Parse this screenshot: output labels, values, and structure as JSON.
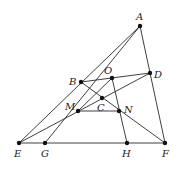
{
  "diagram": {
    "type": "geometry-figure",
    "points": [
      {
        "id": "A",
        "label": "A",
        "x": 140,
        "y": 26,
        "lx": 136,
        "ly": 20
      },
      {
        "id": "B",
        "label": "B",
        "x": 81,
        "y": 82,
        "lx": 69,
        "ly": 85
      },
      {
        "id": "O",
        "label": "O",
        "x": 112,
        "y": 78,
        "lx": 104,
        "ly": 74
      },
      {
        "id": "D",
        "label": "D",
        "x": 150,
        "y": 73,
        "lx": 154,
        "ly": 78
      },
      {
        "id": "C",
        "label": "C",
        "x": 102,
        "y": 98,
        "lx": 97,
        "ly": 111
      },
      {
        "id": "M",
        "label": "M",
        "x": 78,
        "y": 111,
        "lx": 65,
        "ly": 110
      },
      {
        "id": "N",
        "label": "N",
        "x": 119,
        "y": 111,
        "lx": 124,
        "ly": 113
      },
      {
        "id": "E",
        "label": "E",
        "x": 19,
        "y": 143,
        "lx": 14,
        "ly": 157
      },
      {
        "id": "G",
        "label": "G",
        "x": 45,
        "y": 143,
        "lx": 41,
        "ly": 157
      },
      {
        "id": "H",
        "label": "H",
        "x": 127,
        "y": 143,
        "lx": 122,
        "ly": 157
      },
      {
        "id": "F",
        "label": "F",
        "x": 165,
        "y": 143,
        "lx": 162,
        "ly": 157
      }
    ],
    "segments": [
      [
        "E",
        "A"
      ],
      [
        "A",
        "F"
      ],
      [
        "E",
        "F"
      ],
      [
        "A",
        "G"
      ],
      [
        "B",
        "D"
      ],
      [
        "B",
        "F"
      ],
      [
        "E",
        "D"
      ],
      [
        "M",
        "N"
      ],
      [
        "O",
        "H"
      ],
      [
        "O",
        "M"
      ]
    ]
  }
}
